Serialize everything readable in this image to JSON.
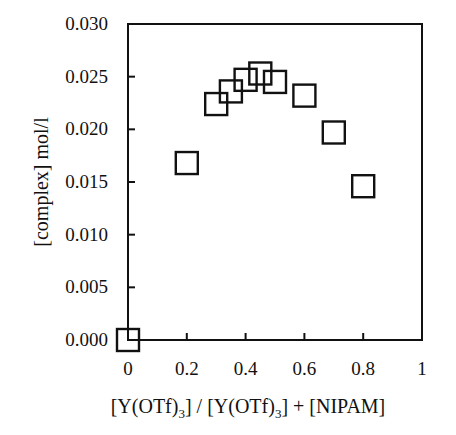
{
  "chart_data": {
    "type": "scatter",
    "title": "",
    "xlabel": "[Y(OTf)3] / [Y(OTf)3] + [NIPAM]",
    "xlabel_parts": {
      "p1": "[Y(OTf)",
      "sub1": "3",
      "p2": "] / [Y(OTf)",
      "sub2": "3",
      "p3": "] + [NIPAM]"
    },
    "ylabel": "[complex] mol/l",
    "xlim": [
      0,
      1
    ],
    "ylim": [
      0,
      0.03
    ],
    "xticks": [
      0,
      0.2,
      0.4,
      0.6,
      0.8,
      1
    ],
    "xtick_labels": [
      "0",
      "0.2",
      "0.4",
      "0.6",
      "0.8",
      "1"
    ],
    "yticks": [
      0,
      0.005,
      0.01,
      0.015,
      0.02,
      0.025,
      0.03
    ],
    "ytick_labels": [
      "0.000",
      "0.005",
      "0.010",
      "0.015",
      "0.020",
      "0.025",
      "0.030"
    ],
    "grid": false,
    "legend": null,
    "marker": "open-square",
    "series": [
      {
        "name": "complex concentration",
        "x": [
          0,
          0.2,
          0.3,
          0.35,
          0.4,
          0.45,
          0.5,
          0.6,
          0.7,
          0.8
        ],
        "y": [
          0.0,
          0.0168,
          0.0224,
          0.0236,
          0.0247,
          0.0253,
          0.0245,
          0.0232,
          0.0197,
          0.0146
        ]
      }
    ]
  },
  "colors": {
    "axis": "#111111",
    "marker": "#111111",
    "background": "#ffffff"
  }
}
